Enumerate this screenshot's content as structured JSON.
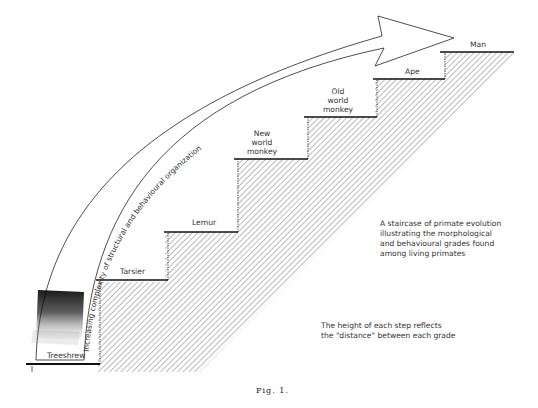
{
  "figure": {
    "caption": "Fig. 1.",
    "arrow_label": "Increasing complexity of structural and behavioural organization",
    "steps": [
      {
        "label": "Treeshrew",
        "lines": [
          "Treeshrew"
        ]
      },
      {
        "label": "Tarsier",
        "lines": [
          "Tarsier"
        ]
      },
      {
        "label": "Lemur",
        "lines": [
          "Lemur"
        ]
      },
      {
        "label": "New world monkey",
        "lines": [
          "New",
          "world",
          "monkey"
        ]
      },
      {
        "label": "Old world monkey",
        "lines": [
          "Old",
          "world",
          "monkey"
        ]
      },
      {
        "label": "Ape",
        "lines": [
          "Ape"
        ]
      },
      {
        "label": "Man",
        "lines": [
          "Man"
        ]
      }
    ],
    "notes": {
      "description": [
        "A staircase of primate evolution",
        "illustrating the morphological",
        "and behavioural grades found",
        "among living primates"
      ],
      "height_note": [
        "The height of each step reflects",
        "the \"distance\" between each grade"
      ]
    }
  }
}
